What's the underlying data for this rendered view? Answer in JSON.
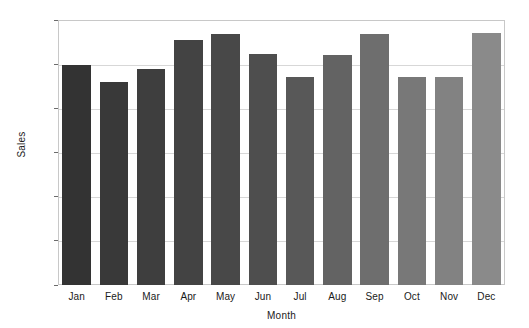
{
  "chart_data": {
    "type": "bar",
    "title": "",
    "xlabel": "Month",
    "ylabel": "Sales",
    "categories": [
      "Jan",
      "Feb",
      "Mar",
      "Apr",
      "May",
      "Jun",
      "Jul",
      "Aug",
      "Sep",
      "Oct",
      "Nov",
      "Dec"
    ],
    "values": [
      995,
      920,
      980,
      1110,
      1135,
      1047,
      940,
      1043,
      1135,
      940,
      940,
      1140
    ],
    "series": [
      {
        "name": "Sales",
        "values": [
          995,
          920,
          980,
          1110,
          1135,
          1047,
          940,
          1043,
          1135,
          940,
          940,
          1140
        ]
      }
    ],
    "bar_colors": [
      "#333333",
      "#393939",
      "#3e3e3e",
      "#434343",
      "#484848",
      "#4e4e4e",
      "#585858",
      "#636363",
      "#6e6e6e",
      "#787878",
      "#828282",
      "#8a8a8a"
    ],
    "ylim": [
      0,
      1200
    ],
    "yticks": [
      0,
      200,
      400,
      600,
      800,
      1000,
      1200
    ],
    "ytick_labels": [
      "0",
      "200",
      "400",
      "600",
      "800",
      "1000",
      "1200"
    ],
    "grid": true,
    "grid_axis": "y",
    "legend": false,
    "legend_position": "none",
    "frame_color": "#c8c8c8",
    "gridline_color": "#d7d7d7",
    "background_color": "#ffffff",
    "text_color": "#1a1a1a"
  }
}
